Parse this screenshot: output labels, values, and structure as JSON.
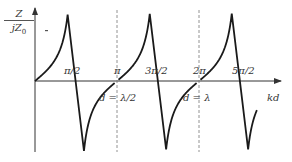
{
  "chart_data": {
    "type": "line",
    "title": "",
    "xlabel": "kd",
    "ylabel": {
      "numerator": "Z",
      "denominator": "jZ",
      "denominator_sub": "0"
    },
    "function": "Z/(jZ0) = tan(kd)",
    "grid": false,
    "legend": null,
    "x_tick_labels": [
      {
        "label": "π/2",
        "value": 1.5708
      },
      {
        "label": "π",
        "value": 3.1416
      },
      {
        "label": "3π/2",
        "value": 4.7124
      },
      {
        "label": "2π",
        "value": 6.2832
      },
      {
        "label": "5π/2",
        "value": 7.854
      }
    ],
    "asymptotes": [
      {
        "x": 3.1416,
        "label": "d = λ/2"
      },
      {
        "x": 6.2832,
        "label": "d = λ"
      }
    ],
    "series": [
      {
        "name": "branch-1",
        "x_range": [
          0,
          3.05
        ]
      },
      {
        "name": "branch-2",
        "x_range": [
          3.2,
          6.19
        ]
      },
      {
        "name": "branch-3",
        "x_range": [
          6.34,
          8.5
        ]
      }
    ],
    "xlim": [
      0,
      9.2
    ],
    "ylim": [
      -3.2,
      3.2
    ]
  },
  "labels": {
    "pi_half": "π/2",
    "pi": "π",
    "three_pi_half": "3π/2",
    "two_pi": "2π",
    "five_pi_half": "5π/2",
    "d_half_lambda": "d = λ/2",
    "d_lambda": "d = λ",
    "kd": "kd",
    "y_num": "Z",
    "y_den": "jZ",
    "y_den_sub": "0"
  },
  "style": {
    "curve_color": "#1a1a1a",
    "axis_color": "#333333",
    "asymptote_color": "#777777"
  }
}
